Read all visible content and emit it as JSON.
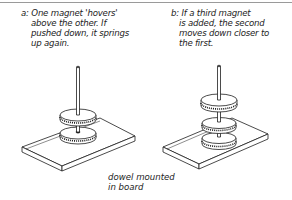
{
  "figure": {
    "panel_a": {
      "label": "a:",
      "lines": [
        "One magnet 'hovers'",
        "above the other. If",
        "pushed down, it springs",
        "up again."
      ],
      "magnet_count": 2
    },
    "panel_b": {
      "label": "b:",
      "lines": [
        "If a third magnet",
        "is added, the second",
        "moves down closer to",
        "the first."
      ],
      "magnet_count": 3
    },
    "annotation": {
      "lines": [
        "dowel mounted",
        "in board"
      ]
    },
    "colors": {
      "ink": "#1d1d1d",
      "background": "#ffffff",
      "rule": "#9a9a9a"
    }
  }
}
